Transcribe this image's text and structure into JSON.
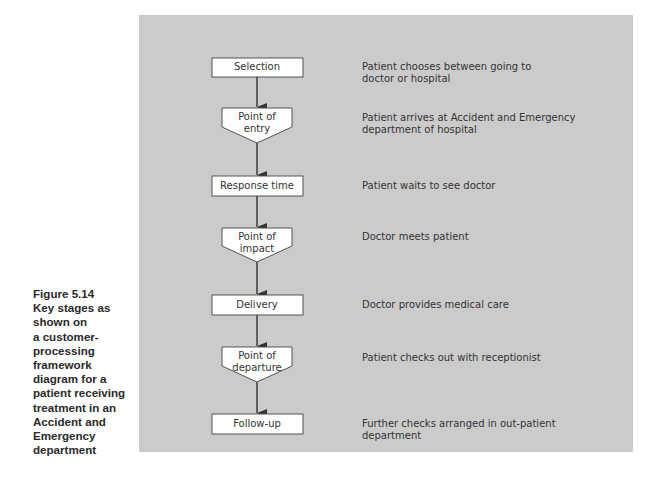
{
  "figure": {
    "caption_lines": [
      "Figure 5.14",
      "Key stages as",
      "shown on",
      "a customer-",
      "processing",
      "framework",
      "diagram for a",
      "patient receiving",
      "treatment in an",
      "Accident and",
      "Emergency",
      "department"
    ],
    "colors": {
      "panel_bg": "#cbcbcb",
      "box_fill": "#ffffff",
      "stroke": "#333333",
      "text": "#333333"
    }
  },
  "stages": [
    {
      "label_lines": [
        "Selection"
      ],
      "shape": "rectangle",
      "description_lines": [
        "Patient chooses between going to",
        "doctor or hospital"
      ]
    },
    {
      "label_lines": [
        "Point of",
        "entry"
      ],
      "shape": "pentagon",
      "description_lines": [
        "Patient arrives at Accident and Emergency",
        "department of hospital"
      ]
    },
    {
      "label_lines": [
        "Response time"
      ],
      "shape": "rectangle",
      "description_lines": [
        "Patient waits to see doctor"
      ]
    },
    {
      "label_lines": [
        "Point of",
        "impact"
      ],
      "shape": "pentagon",
      "description_lines": [
        "Doctor meets patient"
      ]
    },
    {
      "label_lines": [
        "Delivery"
      ],
      "shape": "rectangle",
      "description_lines": [
        "Doctor provides medical care"
      ]
    },
    {
      "label_lines": [
        "Point of",
        "departure"
      ],
      "shape": "pentagon",
      "description_lines": [
        "Patient checks out with receptionist"
      ]
    },
    {
      "label_lines": [
        "Follow-up"
      ],
      "shape": "rectangle",
      "description_lines": [
        "Further checks arranged in out-patient",
        "department"
      ]
    }
  ]
}
